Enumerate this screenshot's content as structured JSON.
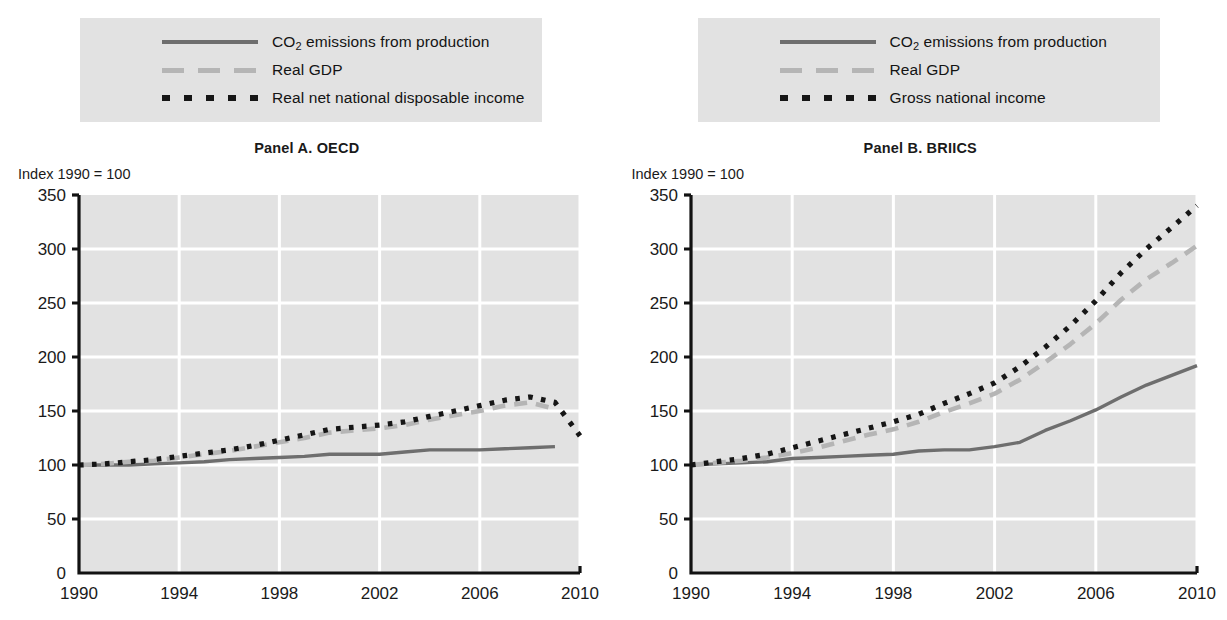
{
  "chart_data": [
    {
      "type": "line",
      "title": "Panel A. OECD",
      "ylabel": "Index 1990 = 100",
      "xlabel": "",
      "ylim": [
        0,
        350
      ],
      "xlim": [
        1990,
        2010
      ],
      "yticks": [
        0,
        50,
        100,
        150,
        200,
        250,
        300,
        350
      ],
      "xticks": [
        1990,
        1994,
        1998,
        2002,
        2006,
        2010
      ],
      "grid": true,
      "legend_position": "above",
      "x": [
        1990,
        1991,
        1992,
        1993,
        1994,
        1995,
        1996,
        1997,
        1998,
        1999,
        2000,
        2001,
        2002,
        2003,
        2004,
        2005,
        2006,
        2007,
        2008,
        2009,
        2010
      ],
      "series": [
        {
          "name": "CO2 emissions from production",
          "style": "solid",
          "color": "#6e6e6e",
          "values": [
            100,
            100,
            100,
            101,
            102,
            103,
            105,
            106,
            107,
            108,
            110,
            110,
            110,
            112,
            114,
            114,
            114,
            115,
            116,
            117,
            null
          ]
        },
        {
          "name": "Real GDP",
          "style": "dashed",
          "color": "#b5b5b5",
          "values": [
            100,
            101,
            103,
            104,
            107,
            110,
            113,
            117,
            121,
            125,
            130,
            132,
            134,
            137,
            142,
            146,
            150,
            155,
            158,
            152,
            null
          ]
        },
        {
          "name": "Real net national disposable income",
          "style": "dotted",
          "color": "#161616",
          "values": [
            100,
            101,
            103,
            105,
            108,
            111,
            114,
            118,
            123,
            128,
            133,
            135,
            137,
            140,
            145,
            150,
            155,
            160,
            163,
            158,
            127
          ]
        }
      ]
    },
    {
      "type": "line",
      "title": "Panel B. BRIICS",
      "ylabel": "Index 1990 = 100",
      "xlabel": "",
      "ylim": [
        0,
        350
      ],
      "xlim": [
        1990,
        2010
      ],
      "yticks": [
        0,
        50,
        100,
        150,
        200,
        250,
        300,
        350
      ],
      "xticks": [
        1990,
        1994,
        1998,
        2002,
        2006,
        2010
      ],
      "grid": true,
      "legend_position": "above",
      "x": [
        1990,
        1991,
        1992,
        1993,
        1994,
        1995,
        1996,
        1997,
        1998,
        1999,
        2000,
        2001,
        2002,
        2003,
        2004,
        2005,
        2006,
        2007,
        2008,
        2009,
        2010
      ],
      "series": [
        {
          "name": "CO2 emissions from production",
          "style": "solid",
          "color": "#6e6e6e",
          "values": [
            100,
            101,
            102,
            103,
            106,
            107,
            108,
            109,
            110,
            113,
            114,
            114,
            117,
            121,
            132,
            141,
            151,
            163,
            174,
            183,
            192
          ]
        },
        {
          "name": "Real GDP",
          "style": "dashed",
          "color": "#b5b5b5",
          "values": [
            100,
            102,
            104,
            107,
            111,
            116,
            122,
            128,
            133,
            140,
            149,
            157,
            166,
            179,
            195,
            212,
            231,
            253,
            272,
            287,
            303
          ]
        },
        {
          "name": "Gross national income",
          "style": "dotted",
          "color": "#161616",
          "values": [
            100,
            103,
            106,
            110,
            116,
            122,
            128,
            134,
            140,
            147,
            157,
            166,
            176,
            191,
            209,
            229,
            252,
            278,
            300,
            320,
            340
          ]
        }
      ]
    }
  ],
  "panels": [
    {
      "id": "panel-a",
      "title": "Panel A. OECD",
      "axis_note": "Index 1990 = 100",
      "legend": [
        {
          "label_prefix": "CO",
          "label_sub": "2",
          "label_suffix": " emissions from production",
          "style": "solid"
        },
        {
          "label_prefix": "Real GDP",
          "label_sub": "",
          "label_suffix": "",
          "style": "dashed"
        },
        {
          "label_prefix": "Real net national disposable income",
          "label_sub": "",
          "label_suffix": "",
          "style": "dotted"
        }
      ],
      "yticks": [
        "350",
        "300",
        "250",
        "200",
        "150",
        "100",
        "50",
        "0"
      ],
      "xticks": [
        "1990",
        "1994",
        "1998",
        "2002",
        "2006",
        "2010"
      ]
    },
    {
      "id": "panel-b",
      "title": "Panel B. BRIICS",
      "axis_note": "Index 1990 = 100",
      "legend": [
        {
          "label_prefix": "CO",
          "label_sub": "2",
          "label_suffix": " emissions from production",
          "style": "solid"
        },
        {
          "label_prefix": "Real GDP",
          "label_sub": "",
          "label_suffix": "",
          "style": "dashed"
        },
        {
          "label_prefix": "Gross national income",
          "label_sub": "",
          "label_suffix": "",
          "style": "dotted"
        }
      ],
      "yticks": [
        "350",
        "300",
        "250",
        "200",
        "150",
        "100",
        "50",
        "0"
      ],
      "xticks": [
        "1990",
        "1994",
        "1998",
        "2002",
        "2006",
        "2010"
      ]
    }
  ],
  "colors": {
    "plot_background": "#e2e2e2",
    "gridline": "#ffffff",
    "axis": "#121212",
    "solid_series": "#6e6e6e",
    "dashed_series": "#b5b5b5",
    "dotted_series": "#161616",
    "legend_background": "#e2e2e2"
  }
}
